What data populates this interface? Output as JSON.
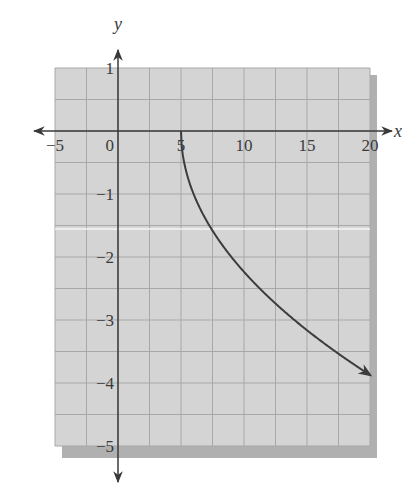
{
  "chart_data": {
    "type": "line",
    "title": "",
    "xlabel": "x",
    "ylabel": "y",
    "xlim": [
      -5,
      20
    ],
    "ylim": [
      -5,
      1
    ],
    "grid": true,
    "grid_step_x": 2.5,
    "grid_step_y": 0.5,
    "x_ticks": [
      -5,
      0,
      5,
      10,
      15,
      20
    ],
    "x_tick_labels": [
      "−5",
      "0",
      "5",
      "10",
      "15",
      "20"
    ],
    "y_ticks": [
      1,
      -1,
      -2,
      -3,
      -4,
      -5
    ],
    "y_tick_labels": [
      "1",
      "−1",
      "−2",
      "−3",
      "−4",
      "−5"
    ],
    "series": [
      {
        "name": "y = -sqrt(x - 5)",
        "x": [
          5,
          5.25,
          6,
          7,
          8,
          9,
          10,
          11,
          12,
          13,
          14,
          15,
          16,
          17,
          18,
          19,
          20
        ],
        "y": [
          0,
          -0.5,
          -1,
          -1.41,
          -1.73,
          -2,
          -2.24,
          -2.45,
          -2.65,
          -2.83,
          -3,
          -3.16,
          -3.32,
          -3.46,
          -3.61,
          -3.74,
          -3.87
        ],
        "endpoint_arrow": "end",
        "start_point": [
          5,
          0
        ]
      }
    ],
    "colors": {
      "grid_background": "#d4d4d4",
      "grid_lines": "#a8a8a8",
      "shadow": "#b0b0b0",
      "axes": "#3a3a3a",
      "curve": "#3c3c3c"
    }
  }
}
